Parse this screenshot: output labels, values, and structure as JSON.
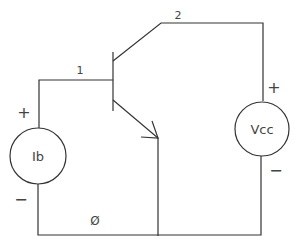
{
  "diagram": {
    "type": "bjt-circuit",
    "nodes": {
      "base": "1",
      "collector": "2",
      "ground": "Ø"
    },
    "sources": {
      "current_source": {
        "label": "Ib",
        "plus": "+",
        "minus": "−"
      },
      "voltage_source": {
        "label": "Vcc",
        "plus": "+",
        "minus": "−"
      }
    },
    "colors": {
      "wire": "#333333",
      "text": "#444444",
      "background": "#ffffff"
    }
  }
}
